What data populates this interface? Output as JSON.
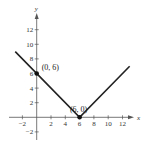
{
  "chart_data": {
    "type": "line",
    "title": "",
    "xlabel": "x",
    "ylabel": "y",
    "xlim": [
      -3,
      13.5
    ],
    "ylim": [
      -3,
      14
    ],
    "grid": false,
    "x_ticks": [
      -2,
      2,
      4,
      6,
      8,
      10,
      12
    ],
    "y_ticks": [
      -2,
      2,
      4,
      6,
      8,
      10,
      12
    ],
    "series": [
      {
        "name": "y = |x - 6|",
        "x": [
          -3,
          6,
          13
        ],
        "y": [
          9,
          0,
          7
        ],
        "color": "#222222"
      }
    ],
    "points": [
      {
        "x": 0,
        "y": 6,
        "label": "(0, 6)"
      },
      {
        "x": 6,
        "y": 0,
        "label": "(6, 0)"
      }
    ]
  },
  "style": {
    "line_color": "#222222",
    "axis_color": "#555555"
  }
}
